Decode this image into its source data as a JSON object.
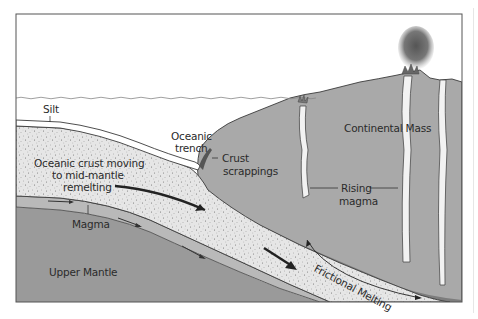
{
  "diagram": {
    "colors": {
      "background": "#ffffff",
      "frame": "#555555",
      "mantle": "#9a9a9a",
      "magma_band": "#b9b9b9",
      "oceanic_crust": "#e6e6e6",
      "crust_speckle": "#8a8a8a",
      "continental_mass": "#a9a9a9",
      "melt_zone": "#7d7d7d",
      "rising_magma": "#f2f2f2",
      "smoke": "#6e6e6e",
      "outline": "#3a3a3a",
      "arrow": "#222222"
    },
    "labels": {
      "silt": "Silt",
      "oceanic_trench_line1": "Oceanic",
      "oceanic_trench_line2": "trench",
      "crust_scrappings_line1": "Crust",
      "crust_scrappings_line2": "scrappings",
      "continental_mass": "Continental Mass",
      "oceanic_crust_line1": "Oceanic crust moving",
      "oceanic_crust_line2": "to mid-mantle",
      "oceanic_crust_line3": "remelting",
      "rising_magma_line1": "Rising",
      "rising_magma_line2": "magma",
      "magma": "Magma",
      "upper_mantle": "Upper Mantle",
      "frictional_melting": "Frictional Melting"
    }
  }
}
